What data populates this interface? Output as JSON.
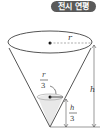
{
  "badge": {
    "label": "전시 연평"
  },
  "diagram": {
    "type": "cone-with-liquid",
    "labels": {
      "radius": "r",
      "height": "h",
      "liquid_radius_num": "r",
      "liquid_radius_den": "3",
      "liquid_height_num": "h",
      "liquid_height_den": "3"
    },
    "colors": {
      "outline": "#555555",
      "liquid": "#e6e6e6",
      "badge_bg": "#5a5a5a"
    }
  }
}
